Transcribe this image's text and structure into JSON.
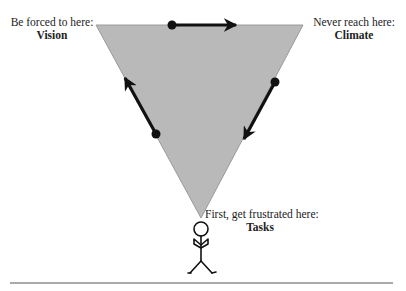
{
  "diagram": {
    "colors": {
      "triangle_fill": "#b9b9b9",
      "triangle_stroke": "#9a9a9a",
      "arrow": "#111111",
      "baseline": "#555555"
    },
    "corners": {
      "vision": {
        "caption": "Be forced to here:",
        "title": "Vision"
      },
      "climate": {
        "caption": "Never reach here:",
        "title": "Climate"
      },
      "tasks": {
        "caption": "First, get frustrated here:",
        "title": "Tasks"
      }
    },
    "arrows": [
      {
        "from": "tasks",
        "to": "vision"
      },
      {
        "from": "vision",
        "to": "climate"
      },
      {
        "from": "climate",
        "to": "tasks"
      }
    ],
    "figure": "stick-person"
  }
}
